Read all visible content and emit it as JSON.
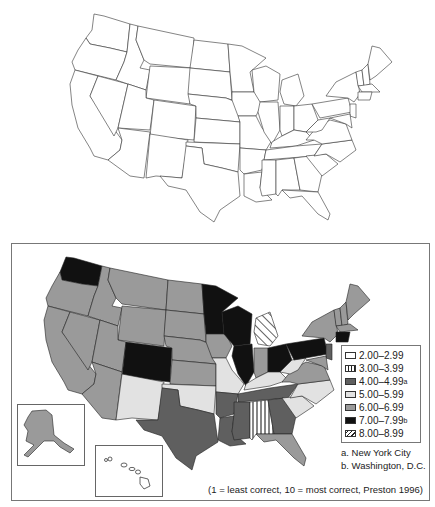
{
  "figure": {
    "top_map": {
      "description": "Blank outline map of the contiguous United States"
    },
    "bottom_map": {
      "description": "Choropleth map of perceived correctness of speech by state"
    }
  },
  "legend": {
    "items": [
      {
        "label": "2.00–2.99",
        "sup": "",
        "pattern": "white",
        "color": "#ffffff"
      },
      {
        "label": "3.00–3.99",
        "sup": "",
        "pattern": "vertical-stripes",
        "color": "#ffffff"
      },
      {
        "label": "4.00–4.99",
        "sup": "a",
        "pattern": "solid",
        "color": "#5f5f5f"
      },
      {
        "label": "5.00–5.99",
        "sup": "",
        "pattern": "solid",
        "color": "#e2e2e2"
      },
      {
        "label": "6.00–6.99",
        "sup": "",
        "pattern": "solid",
        "color": "#9a9a9a"
      },
      {
        "label": "7.00–7.99",
        "sup": "b",
        "pattern": "solid",
        "color": "#111111"
      },
      {
        "label": "8.00–8.99",
        "sup": "",
        "pattern": "diagonal-stripes",
        "color": "#ffffff"
      }
    ]
  },
  "notes": {
    "a": "a. New York City",
    "b": "b. Washington, D.C."
  },
  "caption": "(1 = least correct, 10 = most correct, Preston 1996)",
  "state_categories": {
    "WA": "7.00–7.99",
    "OR": "6.00–6.99",
    "CA": "6.00–6.99",
    "NV": "6.00–6.99",
    "ID": "6.00–6.99",
    "MT": "6.00–6.99",
    "WY": "6.00–6.99",
    "UT": "6.00–6.99",
    "AZ": "6.00–6.99",
    "CO": "7.00–7.99",
    "NM": "5.00–5.99",
    "ND": "6.00–6.99",
    "SD": "6.00–6.99",
    "NE": "6.00–6.99",
    "KS": "6.00–6.99",
    "OK": "5.00–5.99",
    "TX": "4.00–4.99",
    "MN": "7.00–7.99",
    "IA": "6.00–6.99",
    "MO": "5.00–5.99",
    "AR": "4.00–4.99",
    "LA": "4.00–4.99",
    "WI": "7.00–7.99",
    "IL": "7.00–7.99",
    "MI": "8.00–8.99",
    "IN": "6.00–6.99",
    "OH": "7.00–7.99",
    "KY": "5.00–5.99",
    "TN": "4.00–4.99",
    "MS": "4.00–4.99",
    "AL": "3.00–3.99",
    "GA": "4.00–4.99",
    "FL": "6.00–6.99",
    "SC": "5.00–5.99",
    "NC": "5.00–5.99",
    "VA": "6.00–6.99",
    "WV": "5.00–5.99",
    "PA": "7.00–7.99",
    "NY": "6.00–6.99",
    "NJ": "4.00–4.99",
    "CT": "7.00–7.99",
    "MA": "6.00–6.99",
    "VT": "6.00–6.99",
    "NH": "6.00–6.99",
    "ME": "6.00–6.99",
    "MD": "6.00–6.99",
    "DE": "6.00–6.99",
    "AK": "6.00–6.99",
    "HI": "2.00–2.99"
  }
}
